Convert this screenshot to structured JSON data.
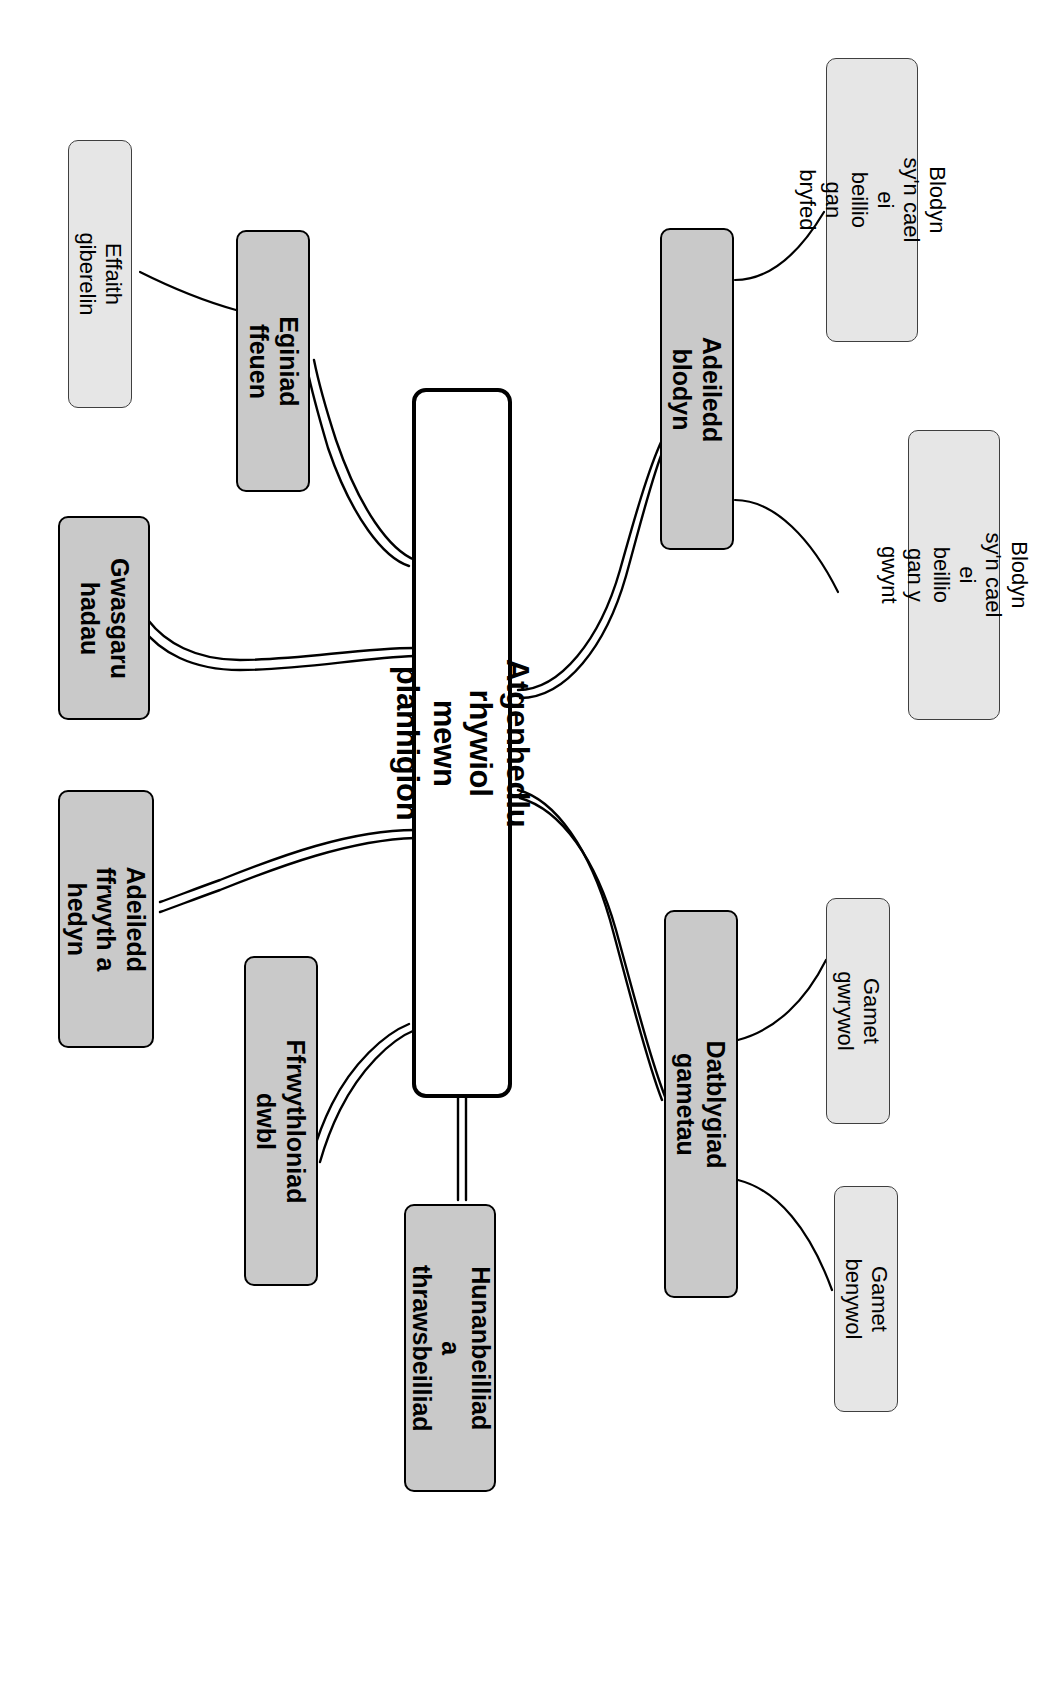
{
  "diagram": {
    "type": "mind-map",
    "language": "cy",
    "orientation": "rotated-90-clockwise",
    "colors": {
      "central_fill": "#ffffff",
      "central_stroke": "#000000",
      "main_fill": "#c9c9c9",
      "main_stroke": "#000000",
      "leaf_fill": "#e6e6e6",
      "leaf_stroke": "#3f3f3f",
      "edge_stroke": "#000000",
      "background": "#ffffff"
    },
    "central": {
      "label": "Atgenhedlu rhywiol mewn planhigion"
    },
    "main_nodes": [
      {
        "id": "adeiledd-blodyn",
        "label": "Adeiledd blodyn"
      },
      {
        "id": "eginiad-ffeuen",
        "label": "Eginiad ffeuen"
      },
      {
        "id": "gwasgaru-hadau",
        "label": "Gwasgaru\nhadau"
      },
      {
        "id": "adeiledd-ffrwyth-a-hedyn",
        "label": "Adeiledd\nffrwyth a hedyn"
      },
      {
        "id": "ffrwythloniad-dwbl",
        "label": "Ffrwythloniad dwbl"
      },
      {
        "id": "hunanbeilliad-a-thrawsbeilliad",
        "label": "Hunanbeilliad a\nthrawsbeilliad"
      },
      {
        "id": "datblygiad-gametau",
        "label": "Datblygiad gametau"
      }
    ],
    "leaf_nodes": [
      {
        "id": "blodyn-pryfed",
        "label": "Blodyn sy'n cael ei\nbeillio gan bryfed",
        "parent": "adeiledd-blodyn"
      },
      {
        "id": "blodyn-gwynt",
        "label": "Blodyn sy'n cael ei\nbeillio gan y gwynt",
        "parent": "adeiledd-blodyn"
      },
      {
        "id": "effaith-giberelin",
        "label": "Effaith giberelin",
        "parent": "eginiad-ffeuen"
      },
      {
        "id": "gamet-gwrywol",
        "label": "Gamet gwrywol",
        "parent": "datblygiad-gametau"
      },
      {
        "id": "gamet-benywol",
        "label": "Gamet benywol",
        "parent": "datblygiad-gametau"
      }
    ],
    "edges": [
      {
        "from": "central",
        "to": "adeiledd-blodyn",
        "style": "double"
      },
      {
        "from": "central",
        "to": "eginiad-ffeuen",
        "style": "double"
      },
      {
        "from": "central",
        "to": "gwasgaru-hadau",
        "style": "double"
      },
      {
        "from": "central",
        "to": "adeiledd-ffrwyth-a-hedyn",
        "style": "double"
      },
      {
        "from": "central",
        "to": "ffrwythloniad-dwbl",
        "style": "double"
      },
      {
        "from": "central",
        "to": "hunanbeilliad-a-thrawsbeilliad",
        "style": "double"
      },
      {
        "from": "central",
        "to": "datblygiad-gametau",
        "style": "double"
      },
      {
        "from": "adeiledd-blodyn",
        "to": "blodyn-pryfed",
        "style": "single"
      },
      {
        "from": "adeiledd-blodyn",
        "to": "blodyn-gwynt",
        "style": "single"
      },
      {
        "from": "eginiad-ffeuen",
        "to": "effaith-giberelin",
        "style": "single"
      },
      {
        "from": "datblygiad-gametau",
        "to": "gamet-gwrywol",
        "style": "single"
      },
      {
        "from": "datblygiad-gametau",
        "to": "gamet-benywol",
        "style": "single"
      }
    ]
  }
}
